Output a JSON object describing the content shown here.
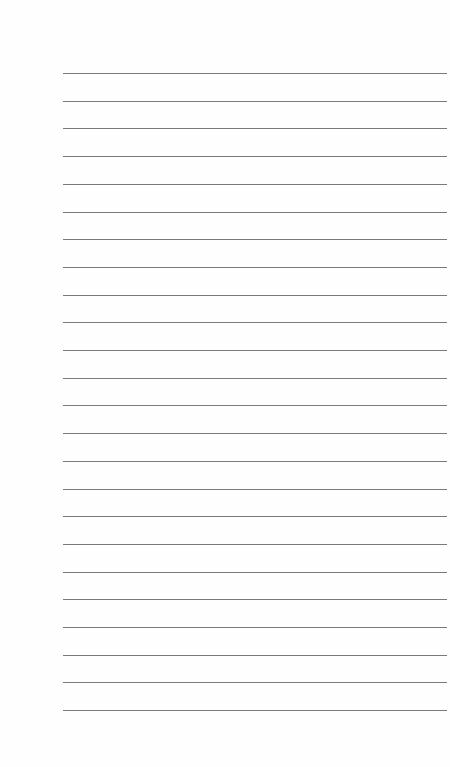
{
  "page": {
    "type": "lined-paper",
    "line_count": 24,
    "first_line_y": 73,
    "line_spacing": 27.7,
    "line_left": 63,
    "line_width": 384,
    "line_color": "#7a7a7a",
    "background_color": "#fefefe"
  }
}
